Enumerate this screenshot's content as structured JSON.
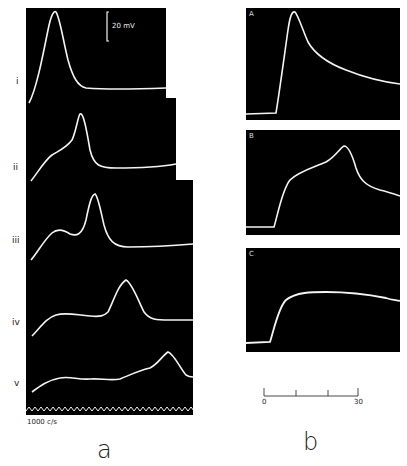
{
  "figure": {
    "panel_a": {
      "label": "a",
      "scale_bar_label": "20 mV",
      "timebase_label": "1000 c/s",
      "traces": [
        {
          "id": "i",
          "label": "i"
        },
        {
          "id": "ii",
          "label": "ii"
        },
        {
          "id": "iii",
          "label": "iii"
        },
        {
          "id": "iv",
          "label": "iv"
        },
        {
          "id": "v",
          "label": "v"
        }
      ]
    },
    "panel_b": {
      "label": "b",
      "subpanels": [
        {
          "id": "A",
          "label": "A"
        },
        {
          "id": "B",
          "label": "B"
        },
        {
          "id": "C",
          "label": "C"
        }
      ],
      "time_scale": {
        "start_label": "0",
        "end_label": "30",
        "ticks": 4
      }
    },
    "colors": {
      "background": "#ffffff",
      "oscilloscope": "#000000",
      "trace": "#f4f4f4"
    }
  }
}
